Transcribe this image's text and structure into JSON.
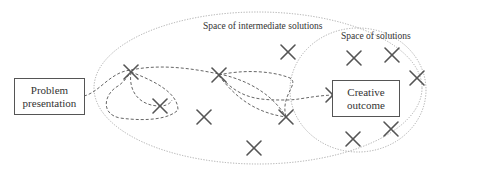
{
  "diagram": {
    "labels": {
      "intermediate_space": "Space of intermediate solutions",
      "solution_space": "Space of solutions"
    },
    "problem_box": {
      "line1": "Problem",
      "line2": "presentation"
    },
    "outcome_box": {
      "line1": "Creative",
      "line2": "outcome"
    },
    "colors": {
      "ellipse": "#aaaaaa",
      "path": "#666666",
      "cross": "#555555",
      "box_border": "#555555"
    },
    "crosses": [
      {
        "x": 131,
        "y": 72
      },
      {
        "x": 160,
        "y": 106
      },
      {
        "x": 204,
        "y": 117
      },
      {
        "x": 219,
        "y": 75
      },
      {
        "x": 288,
        "y": 52
      },
      {
        "x": 286,
        "y": 117
      },
      {
        "x": 254,
        "y": 148
      },
      {
        "x": 354,
        "y": 58
      },
      {
        "x": 392,
        "y": 55
      },
      {
        "x": 417,
        "y": 78
      },
      {
        "x": 333,
        "y": 95
      },
      {
        "x": 353,
        "y": 139
      },
      {
        "x": 391,
        "y": 129
      }
    ]
  }
}
